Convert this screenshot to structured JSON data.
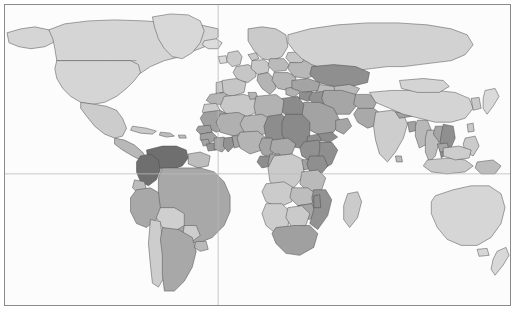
{
  "figure": {
    "type": "choropleth-world-map",
    "title": "",
    "projection": "equirectangular",
    "width": 515,
    "height": 310,
    "background_color": "#ffffff",
    "ocean_color": "#fcfcfc",
    "frame": {
      "border_color": "#8a8a8a",
      "border_width": 1,
      "inset": 4
    },
    "graticule": {
      "visible": true,
      "color": "#b9b9b9",
      "lines": [
        {
          "name": "equator",
          "orientation": "horizontal",
          "y_px": 170
        },
        {
          "name": "prime-meridian",
          "orientation": "vertical",
          "x_px": 214
        }
      ]
    },
    "border_color": "#5d5d5d"
  },
  "legend": {
    "visible": false,
    "classes": [
      {
        "key": "no-data",
        "label": "",
        "color": "#fcfcfc"
      },
      {
        "key": "level-1",
        "label": "",
        "color": "#d8d8d8"
      },
      {
        "key": "level-2",
        "label": "",
        "color": "#c9c9c9"
      },
      {
        "key": "level-3",
        "label": "",
        "color": "#b6b6b6"
      },
      {
        "key": "level-4",
        "label": "",
        "color": "#9e9e9e"
      },
      {
        "key": "level-5",
        "label": "",
        "color": "#8a8a8a"
      },
      {
        "key": "level-6",
        "label": "",
        "color": "#6f6f6f"
      }
    ]
  },
  "chart_data": {
    "type": "heatmap",
    "title": "",
    "xlabel": "",
    "ylabel": "",
    "palette": [
      "#e2e2e2",
      "#d8d8d8",
      "#c9c9c9",
      "#b6b6b6",
      "#9e9e9e",
      "#8a8a8a",
      "#6f6f6f"
    ],
    "regions": [
      {
        "name": "Greenland",
        "level": 1,
        "color": "#d8d8d8"
      },
      {
        "name": "Canada",
        "level": 1,
        "color": "#d5d5d5"
      },
      {
        "name": "United States",
        "level": 1,
        "color": "#d5d5d5"
      },
      {
        "name": "Alaska",
        "level": 1,
        "color": "#d5d5d5"
      },
      {
        "name": "Mexico",
        "level": 2,
        "color": "#cccccc"
      },
      {
        "name": "Central America",
        "level": 3,
        "color": "#b8b8b8"
      },
      {
        "name": "Cuba",
        "level": 2,
        "color": "#c9c9c9"
      },
      {
        "name": "Caribbean",
        "level": 3,
        "color": "#bdbdbd"
      },
      {
        "name": "Colombia",
        "level": 6,
        "color": "#6f6f6f"
      },
      {
        "name": "Venezuela",
        "level": 6,
        "color": "#6f6f6f"
      },
      {
        "name": "Guyanas",
        "level": 3,
        "color": "#bdbdbd"
      },
      {
        "name": "Brazil",
        "level": 4,
        "color": "#a8a8a8"
      },
      {
        "name": "Ecuador",
        "level": 3,
        "color": "#bcbcbc"
      },
      {
        "name": "Peru",
        "level": 4,
        "color": "#a8a8a8"
      },
      {
        "name": "Bolivia",
        "level": 2,
        "color": "#cfcfcf"
      },
      {
        "name": "Paraguay",
        "level": 2,
        "color": "#cdcdcd"
      },
      {
        "name": "Chile",
        "level": 2,
        "color": "#cdcdcd"
      },
      {
        "name": "Argentina",
        "level": 4,
        "color": "#a8a8a8"
      },
      {
        "name": "Uruguay",
        "level": 3,
        "color": "#bababa"
      },
      {
        "name": "Iceland",
        "level": 1,
        "color": "#dcdcdc"
      },
      {
        "name": "Scandinavia",
        "level": 2,
        "color": "#cacaca"
      },
      {
        "name": "United Kingdom",
        "level": 2,
        "color": "#cacaca"
      },
      {
        "name": "Ireland",
        "level": 1,
        "color": "#d9d9d9"
      },
      {
        "name": "France",
        "level": 2,
        "color": "#c6c6c6"
      },
      {
        "name": "Spain",
        "level": 2,
        "color": "#c6c6c6"
      },
      {
        "name": "Portugal",
        "level": 2,
        "color": "#cbcbcb"
      },
      {
        "name": "Germany",
        "level": 2,
        "color": "#c8c8c8"
      },
      {
        "name": "Poland",
        "level": 3,
        "color": "#bababa"
      },
      {
        "name": "Italy",
        "level": 3,
        "color": "#b4b4b4"
      },
      {
        "name": "Balkans",
        "level": 3,
        "color": "#b6b6b6"
      },
      {
        "name": "Greece",
        "level": 3,
        "color": "#b2b2b2"
      },
      {
        "name": "Ukraine",
        "level": 3,
        "color": "#b8b8b8"
      },
      {
        "name": "Belarus",
        "level": 2,
        "color": "#c6c6c6"
      },
      {
        "name": "Russia",
        "level": 1,
        "color": "#d2d2d2"
      },
      {
        "name": "Turkey",
        "level": 4,
        "color": "#a4a4a4"
      },
      {
        "name": "Kazakhstan",
        "level": 5,
        "color": "#8f8f8f"
      },
      {
        "name": "Uzbekistan",
        "level": 3,
        "color": "#b9b9b9"
      },
      {
        "name": "Turkmenistan",
        "level": 3,
        "color": "#bcbcbc"
      },
      {
        "name": "Iran",
        "level": 4,
        "color": "#a6a6a6"
      },
      {
        "name": "Iraq",
        "level": 5,
        "color": "#929292"
      },
      {
        "name": "Syria",
        "level": 5,
        "color": "#8e8e8e"
      },
      {
        "name": "Saudi Arabia",
        "level": 4,
        "color": "#a3a3a3"
      },
      {
        "name": "Yemen",
        "level": 5,
        "color": "#8c8c8c"
      },
      {
        "name": "Oman",
        "level": 4,
        "color": "#a5a5a5"
      },
      {
        "name": "Afghanistan",
        "level": 4,
        "color": "#a9a9a9"
      },
      {
        "name": "Pakistan",
        "level": 4,
        "color": "#a9a9a9"
      },
      {
        "name": "India",
        "level": 2,
        "color": "#cdcdcd"
      },
      {
        "name": "Nepal",
        "level": 4,
        "color": "#a2a2a2"
      },
      {
        "name": "Bangladesh",
        "level": 4,
        "color": "#a2a2a2"
      },
      {
        "name": "Myanmar",
        "level": 3,
        "color": "#b8b8b8"
      },
      {
        "name": "Thailand",
        "level": 3,
        "color": "#bdbdbd"
      },
      {
        "name": "Laos",
        "level": 4,
        "color": "#a5a5a5"
      },
      {
        "name": "Vietnam",
        "level": 5,
        "color": "#8f8f8f"
      },
      {
        "name": "Cambodia",
        "level": 4,
        "color": "#a6a6a6"
      },
      {
        "name": "China",
        "level": 1,
        "color": "#d4d4d4"
      },
      {
        "name": "Mongolia",
        "level": 1,
        "color": "#d4d4d4"
      },
      {
        "name": "Japan",
        "level": 1,
        "color": "#dadada"
      },
      {
        "name": "Korea",
        "level": 2,
        "color": "#c9c9c9"
      },
      {
        "name": "Philippines",
        "level": 2,
        "color": "#cbcbcb"
      },
      {
        "name": "Indonesia",
        "level": 2,
        "color": "#cacaca"
      },
      {
        "name": "Malaysia",
        "level": 2,
        "color": "#cdcdcd"
      },
      {
        "name": "Papua New Guinea",
        "level": 3,
        "color": "#bcbcbc"
      },
      {
        "name": "Australia",
        "level": 1,
        "color": "#d6d6d6"
      },
      {
        "name": "New Zealand",
        "level": 1,
        "color": "#d8d8d8"
      },
      {
        "name": "Morocco",
        "level": 3,
        "color": "#b5b5b5"
      },
      {
        "name": "Algeria",
        "level": 2,
        "color": "#c8c8c8"
      },
      {
        "name": "Tunisia",
        "level": 3,
        "color": "#b4b4b4"
      },
      {
        "name": "Libya",
        "level": 3,
        "color": "#b2b2b2"
      },
      {
        "name": "Egypt",
        "level": 5,
        "color": "#8b8b8b"
      },
      {
        "name": "Western Sahara",
        "level": 2,
        "color": "#cccccc"
      },
      {
        "name": "Mauritania",
        "level": 4,
        "color": "#a0a0a0"
      },
      {
        "name": "Mali",
        "level": 3,
        "color": "#b0b0b0"
      },
      {
        "name": "Niger",
        "level": 3,
        "color": "#b6b6b6"
      },
      {
        "name": "Chad",
        "level": 5,
        "color": "#8d8d8d"
      },
      {
        "name": "Sudan",
        "level": 5,
        "color": "#8a8a8a"
      },
      {
        "name": "Eritrea",
        "level": 5,
        "color": "#8e8e8e"
      },
      {
        "name": "Ethiopia",
        "level": 5,
        "color": "#909090"
      },
      {
        "name": "Somalia",
        "level": 5,
        "color": "#8f8f8f"
      },
      {
        "name": "Senegal",
        "level": 4,
        "color": "#9e9e9e"
      },
      {
        "name": "Guinea",
        "level": 4,
        "color": "#a1a1a1"
      },
      {
        "name": "Sierra Leone",
        "level": 4,
        "color": "#a4a4a4"
      },
      {
        "name": "Liberia",
        "level": 5,
        "color": "#949494"
      },
      {
        "name": "Ivory Coast",
        "level": 4,
        "color": "#a6a6a6"
      },
      {
        "name": "Ghana",
        "level": 5,
        "color": "#929292"
      },
      {
        "name": "Togo",
        "level": 4,
        "color": "#a3a3a3"
      },
      {
        "name": "Benin",
        "level": 4,
        "color": "#a5a5a5"
      },
      {
        "name": "Nigeria",
        "level": 3,
        "color": "#b4b4b4"
      },
      {
        "name": "Cameroon",
        "level": 4,
        "color": "#a4a4a4"
      },
      {
        "name": "Central African Republic",
        "level": 4,
        "color": "#a9a9a9"
      },
      {
        "name": "Gabon",
        "level": 5,
        "color": "#8e8e8e"
      },
      {
        "name": "Congo",
        "level": 4,
        "color": "#a6a6a6"
      },
      {
        "name": "DR Congo",
        "level": 2,
        "color": "#cacaca"
      },
      {
        "name": "Uganda",
        "level": 4,
        "color": "#a2a2a2"
      },
      {
        "name": "Kenya",
        "level": 5,
        "color": "#8f8f8f"
      },
      {
        "name": "Tanzania",
        "level": 3,
        "color": "#bababa"
      },
      {
        "name": "Angola",
        "level": 2,
        "color": "#cbcbcb"
      },
      {
        "name": "Zambia",
        "level": 3,
        "color": "#bdbdbd"
      },
      {
        "name": "Zimbabwe",
        "level": 4,
        "color": "#a5a5a5"
      },
      {
        "name": "Mozambique",
        "level": 5,
        "color": "#929292"
      },
      {
        "name": "Namibia",
        "level": 2,
        "color": "#cdcdcd"
      },
      {
        "name": "Botswana",
        "level": 2,
        "color": "#cacaca"
      },
      {
        "name": "South Africa",
        "level": 4,
        "color": "#a0a0a0"
      },
      {
        "name": "Madagascar",
        "level": 2,
        "color": "#cbcbcb"
      }
    ]
  }
}
